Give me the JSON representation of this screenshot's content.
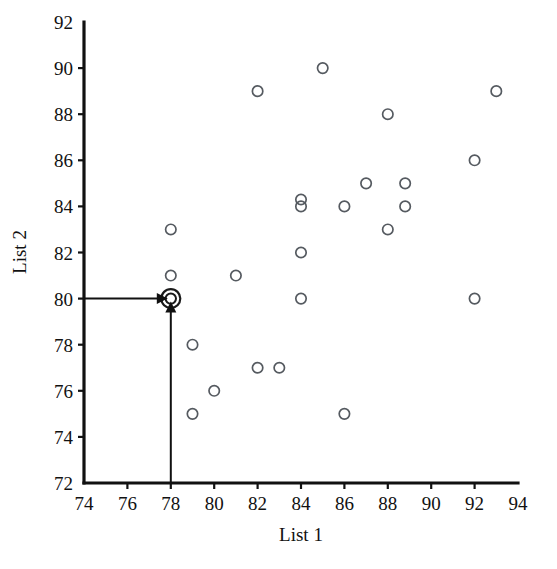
{
  "chart_data": {
    "type": "scatter",
    "title": "",
    "xlabel": "List 1",
    "ylabel": "List 2",
    "xlim": [
      74,
      94
    ],
    "ylim": [
      72,
      92
    ],
    "xticks": [
      74,
      76,
      78,
      80,
      82,
      84,
      86,
      88,
      90,
      92,
      94
    ],
    "yticks": [
      72,
      74,
      76,
      78,
      80,
      82,
      84,
      86,
      88,
      90,
      92
    ],
    "grid": false,
    "legend": null,
    "marker_style": "open-circle",
    "points": [
      {
        "x": 78,
        "y": 83
      },
      {
        "x": 78,
        "y": 81
      },
      {
        "x": 78,
        "y": 80
      },
      {
        "x": 79,
        "y": 78
      },
      {
        "x": 79,
        "y": 75
      },
      {
        "x": 80,
        "y": 76
      },
      {
        "x": 81,
        "y": 81
      },
      {
        "x": 82,
        "y": 89
      },
      {
        "x": 82,
        "y": 77
      },
      {
        "x": 83,
        "y": 77
      },
      {
        "x": 84,
        "y": 84
      },
      {
        "x": 84,
        "y": 84.3
      },
      {
        "x": 84,
        "y": 82
      },
      {
        "x": 84,
        "y": 80
      },
      {
        "x": 85,
        "y": 90
      },
      {
        "x": 86,
        "y": 84
      },
      {
        "x": 86,
        "y": 75
      },
      {
        "x": 87,
        "y": 85
      },
      {
        "x": 88,
        "y": 88
      },
      {
        "x": 88,
        "y": 83
      },
      {
        "x": 88.8,
        "y": 85
      },
      {
        "x": 88.8,
        "y": 84
      },
      {
        "x": 92,
        "y": 86
      },
      {
        "x": 92,
        "y": 80
      },
      {
        "x": 93,
        "y": 89
      }
    ],
    "highlighted_point": {
      "x": 78,
      "y": 80,
      "style": "double-circle"
    },
    "annotations": [
      {
        "name": "y-value-pointer",
        "type": "arrow",
        "from": {
          "x": 74,
          "y": 80
        },
        "to": {
          "x": 78,
          "y": 80
        },
        "direction": "right"
      },
      {
        "name": "x-value-pointer",
        "type": "arrow",
        "from": {
          "x": 78,
          "y": 72
        },
        "to": {
          "x": 78,
          "y": 80
        },
        "direction": "up"
      }
    ]
  },
  "axes": {
    "x_title": "List 1",
    "y_title": "List 2",
    "x_tick_labels": [
      "74",
      "76",
      "78",
      "80",
      "82",
      "84",
      "86",
      "88",
      "90",
      "92",
      "94"
    ],
    "y_tick_labels": [
      "72",
      "74",
      "76",
      "78",
      "80",
      "82",
      "84",
      "86",
      "88",
      "90",
      "92"
    ]
  },
  "colors": {
    "background": "#ffffff",
    "axis": "#111111",
    "marker": "#555a60",
    "highlight": "#1a1a1a",
    "pointer": "#111111"
  }
}
